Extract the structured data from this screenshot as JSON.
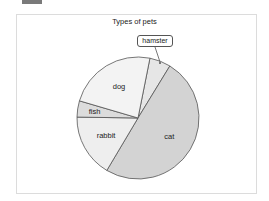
{
  "chart_data": {
    "type": "pie",
    "title": "Types of pets",
    "categories": [
      "hamster",
      "cat",
      "rabbit",
      "fish",
      "dog"
    ],
    "values": [
      5.6,
      49.8,
      16.7,
      4.3,
      23.6
    ],
    "start_angle_deg_clockwise_from_top": 11.3,
    "direction": "clockwise",
    "colors": [
      "#e6e6e6",
      "#d3d3d3",
      "#eeeeee",
      "#dcdcdc",
      "#f3f3f3"
    ],
    "stroke_color": "#555555",
    "label_positions": "inside",
    "callout_labels": [
      "hamster"
    ],
    "legend": "none",
    "xlabel": "",
    "ylabel": ""
  },
  "chart": {
    "title": "Types of pets",
    "callout_label": "hamster",
    "center": [
      138,
      118
    ],
    "radius": 61
  }
}
